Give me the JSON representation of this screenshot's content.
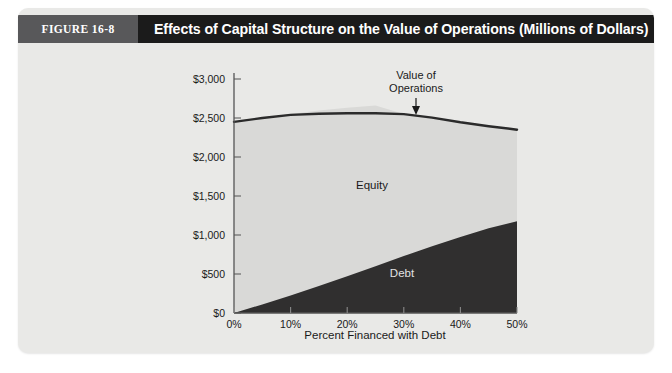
{
  "figure": {
    "number_label": "FIGURE 16-8",
    "title": "Effects of Capital Structure on the Value of Operations (Millions of Dollars)"
  },
  "colors": {
    "header_bar": "#1b1b1b",
    "figure_block": "#58585a",
    "card_background": "#e9e9e7",
    "equity_area": "#d9d9d7",
    "debt_area": "#302f2f",
    "value_line": "#2b2b2b",
    "axis": "#555555"
  },
  "chart_data": {
    "type": "area",
    "title": "Effects of Capital Structure on the Value of Operations (Millions of Dollars)",
    "xlabel": "Percent Financed with Debt",
    "ylabel": "",
    "xlim": [
      0,
      50
    ],
    "ylim": [
      0,
      3000
    ],
    "grid": false,
    "legend": "inline-annotations",
    "x": [
      0,
      5,
      10,
      15,
      20,
      25,
      30,
      35,
      40,
      45,
      50
    ],
    "xtick_labels": [
      "0%",
      "10%",
      "20%",
      "30%",
      "40%",
      "50%"
    ],
    "xticks": [
      0,
      10,
      20,
      30,
      40,
      50
    ],
    "ytick_labels": [
      "$0",
      "$500",
      "$1,000",
      "$1,500",
      "$2,000",
      "$2,500",
      "$3,000"
    ],
    "yticks": [
      0,
      500,
      1000,
      1500,
      2000,
      2500,
      3000
    ],
    "series": [
      {
        "name": "Debt",
        "type": "area",
        "stacked_order": 1,
        "values": [
          0,
          110,
          225,
          345,
          470,
          600,
          730,
          855,
          975,
          1085,
          1175
        ]
      },
      {
        "name": "Equity",
        "type": "area",
        "stacked_order": 2,
        "values": [
          2450,
          2390,
          2325,
          2250,
          2160,
          2060,
          1820,
          1650,
          1470,
          1300,
          1175
        ]
      },
      {
        "name": "Value of Operations",
        "type": "line",
        "values": [
          2450,
          2500,
          2540,
          2555,
          2560,
          2560,
          2550,
          2505,
          2445,
          2395,
          2350
        ]
      }
    ],
    "annotations": [
      {
        "text": "Value of Operations",
        "target_x": 30,
        "target_y": 2550
      },
      {
        "text": "Equity",
        "x": 22,
        "y": 1550
      },
      {
        "text": "Debt",
        "x": 33,
        "y": 520
      }
    ]
  },
  "labels": {
    "value_of_operations_line1": "Value of",
    "value_of_operations_line2": "Operations",
    "equity": "Equity",
    "debt": "Debt",
    "xaxis_title": "Percent Financed with Debt"
  }
}
